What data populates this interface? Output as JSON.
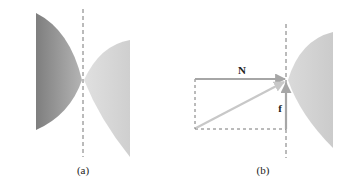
{
  "panels": {
    "a": {
      "caption": "(a)"
    },
    "b": {
      "caption": "(b)",
      "normal_label": "N",
      "friction_label": "f"
    }
  },
  "colors": {
    "dark_body": "#8a8a8a",
    "light_body": "#d4d4d4",
    "arrow": "#a6a6a6",
    "resultant": "#c8c8c8",
    "dashed": "#777777",
    "text": "#222222"
  }
}
